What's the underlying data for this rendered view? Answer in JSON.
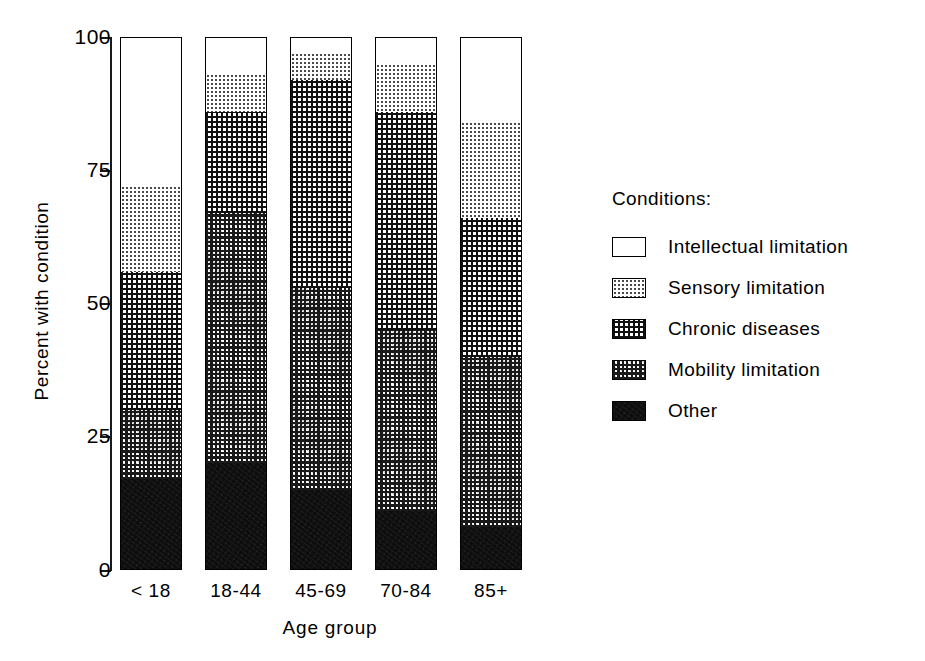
{
  "chart_data": {
    "type": "bar",
    "subtype": "stacked-bar-100-percent",
    "title": "",
    "xlabel": "Age group",
    "ylabel": "Percent with condition",
    "categories": [
      "< 18",
      "18-44",
      "45-69",
      "70-84",
      "85+"
    ],
    "ylim": [
      0,
      100
    ],
    "yticks": [
      0,
      25,
      50,
      75,
      100
    ],
    "ytick_labels": [
      "0",
      "25",
      "50",
      "75",
      "100"
    ],
    "grid": false,
    "legend_position": "right",
    "legend_title": "Conditions:",
    "stack_order_bottom_to_top": [
      "Other",
      "Mobility limitation",
      "Chronic diseases",
      "Sensory limitation",
      "Intellectual limitation"
    ],
    "series": [
      {
        "name": "Other",
        "values": [
          17,
          20,
          15,
          11,
          8
        ]
      },
      {
        "name": "Mobility limitation",
        "values": [
          13,
          47,
          38,
          34,
          32
        ]
      },
      {
        "name": "Chronic diseases",
        "values": [
          26,
          19,
          39,
          41,
          26
        ]
      },
      {
        "name": "Sensory limitation",
        "values": [
          16,
          7,
          5,
          9,
          18
        ]
      },
      {
        "name": "Intellectual limitation",
        "values": [
          28,
          7,
          3,
          5,
          16
        ]
      }
    ],
    "cumulative_tops": {
      "< 18": {
        "other": 17,
        "mobility": 30,
        "chronic": 56,
        "sensory": 72,
        "intellectual": 100
      },
      "18-44": {
        "other": 20,
        "mobility": 67,
        "chronic": 86,
        "sensory": 93,
        "intellectual": 100
      },
      "45-69": {
        "other": 15,
        "mobility": 53,
        "chronic": 92,
        "sensory": 97,
        "intellectual": 100
      },
      "70-84": {
        "other": 11,
        "mobility": 45,
        "chronic": 86,
        "sensory": 95,
        "intellectual": 100
      },
      "85+": {
        "other": 8,
        "mobility": 40,
        "chronic": 66,
        "sensory": 84,
        "intellectual": 100
      }
    }
  },
  "axes": {
    "y_title": "Percent with condition",
    "x_title": "Age group",
    "y_ticks": [
      "100",
      "75",
      "50",
      "25",
      "0"
    ],
    "x_ticks": [
      "< 18",
      "18-44",
      "45-69",
      "70-84",
      "85+"
    ]
  },
  "legend": {
    "title": "Conditions:",
    "items": [
      {
        "label": "Intellectual limitation",
        "pattern": "white",
        "swatch_name": "swatch-intellectual"
      },
      {
        "label": "Sensory limitation",
        "pattern": "light-dots",
        "swatch_name": "swatch-sensory"
      },
      {
        "label": "Chronic diseases",
        "pattern": "fine-grid-dots",
        "swatch_name": "swatch-chronic"
      },
      {
        "label": "Mobility limitation",
        "pattern": "dense-checker",
        "swatch_name": "swatch-mobility"
      },
      {
        "label": "Other",
        "pattern": "solid-black",
        "swatch_name": "swatch-other"
      }
    ]
  },
  "colors": {
    "ink": "#000000",
    "background": "#ffffff",
    "solid_fill": "#0d0d0d"
  }
}
